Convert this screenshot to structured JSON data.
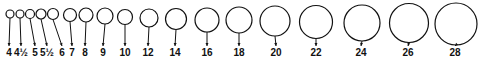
{
  "diagram": {
    "stroke_color": "#111111",
    "background": "#ffffff",
    "label_baseline_y": 56,
    "rings": [
      {
        "label": "4",
        "cx": 10,
        "cy": 14,
        "r": 4.0,
        "label_x": 9
      },
      {
        "label": "4½",
        "cx": 20,
        "cy": 14,
        "r": 4.0,
        "label_x": 21
      },
      {
        "label": "5",
        "cx": 30,
        "cy": 14,
        "r": 4.5,
        "label_x": 35
      },
      {
        "label": "5½",
        "cx": 41,
        "cy": 14,
        "r": 5.0,
        "label_x": 47
      },
      {
        "label": "6",
        "cx": 53,
        "cy": 14,
        "r": 5.5,
        "label_x": 62
      },
      {
        "label": "7",
        "cx": 70,
        "cy": 15,
        "r": 6.5,
        "label_x": 72
      },
      {
        "label": "8",
        "cx": 86,
        "cy": 15,
        "r": 7.0,
        "label_x": 85
      },
      {
        "label": "9",
        "cx": 105,
        "cy": 16,
        "r": 8.0,
        "label_x": 103
      },
      {
        "label": "10",
        "cx": 125,
        "cy": 17,
        "r": 7.5,
        "label_x": 125
      },
      {
        "label": "12",
        "cx": 149,
        "cy": 18,
        "r": 9.0,
        "label_x": 148
      },
      {
        "label": "14",
        "cx": 176,
        "cy": 19,
        "r": 10.5,
        "label_x": 175
      },
      {
        "label": "16",
        "cx": 207,
        "cy": 20,
        "r": 12.0,
        "label_x": 207
      },
      {
        "label": "18",
        "cx": 239,
        "cy": 20,
        "r": 13.0,
        "label_x": 239
      },
      {
        "label": "20",
        "cx": 275,
        "cy": 21,
        "r": 15.0,
        "label_x": 276
      },
      {
        "label": "22",
        "cx": 316,
        "cy": 22,
        "r": 16.5,
        "label_x": 316
      },
      {
        "label": "24",
        "cx": 362,
        "cy": 23,
        "r": 18.0,
        "label_x": 361
      },
      {
        "label": "26",
        "cx": 409,
        "cy": 23,
        "r": 19.5,
        "label_x": 408
      },
      {
        "label": "28",
        "cx": 456,
        "cy": 24,
        "r": 21.0,
        "label_x": 455
      }
    ]
  }
}
